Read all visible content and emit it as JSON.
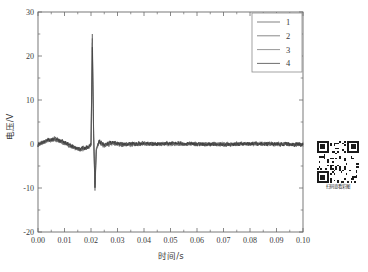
{
  "chart_data": {
    "type": "line",
    "title": "",
    "xlabel": "时间/s",
    "ylabel": "电压/V",
    "xlim": [
      0.0,
      0.1
    ],
    "ylim": [
      -20,
      30
    ],
    "xticks": [
      "0.00",
      "0.01",
      "0.02",
      "0.03",
      "0.04",
      "0.05",
      "0.06",
      "0.07",
      "0.08",
      "0.09",
      "0.10"
    ],
    "xtick_values": [
      0.0,
      0.01,
      0.02,
      0.03,
      0.04,
      0.05,
      0.06,
      0.07,
      0.08,
      0.09,
      0.1
    ],
    "yticks": [
      "30",
      "20",
      "10",
      "0",
      "-10",
      "-20"
    ],
    "ytick_values": [
      30,
      20,
      10,
      0,
      -10,
      -20
    ],
    "minor_tick_step_y": 5,
    "minor_tick_step_x": 0.005,
    "grid": false,
    "legend_position": "top-right",
    "legend_frame": true,
    "legend": [
      "1",
      "2",
      "3",
      "4"
    ],
    "series": [
      {
        "name": "1",
        "color": "#4a4a4a",
        "linewidth": 0.55,
        "noise_amp": 0.45,
        "noise_seed": 11,
        "spike_peak": 25.0,
        "spike_trough": -10.6,
        "x": [
          0.0,
          0.002,
          0.004,
          0.006,
          0.008,
          0.01,
          0.012,
          0.014,
          0.016,
          0.018,
          0.02,
          0.0205,
          0.021,
          0.0215,
          0.022,
          0.023,
          0.025,
          0.028,
          0.032,
          0.04,
          0.05,
          0.06,
          0.07,
          0.08,
          0.09,
          0.1
        ],
        "y": [
          -0.2,
          0.3,
          0.8,
          1.0,
          0.8,
          0.3,
          -0.3,
          -0.9,
          -1.3,
          -1.0,
          -0.4,
          25.0,
          2.0,
          -10.6,
          -1.5,
          0.6,
          -0.4,
          0.2,
          -0.2,
          0.0,
          0.1,
          -0.1,
          0.0,
          0.1,
          -0.1,
          -0.2
        ]
      },
      {
        "name": "2",
        "color": "#585858",
        "linewidth": 0.55,
        "noise_amp": 0.42,
        "noise_seed": 23,
        "spike_peak": 24.0,
        "spike_trough": -9.8,
        "x": [
          0.0,
          0.002,
          0.004,
          0.006,
          0.008,
          0.01,
          0.012,
          0.014,
          0.016,
          0.018,
          0.02,
          0.0205,
          0.021,
          0.0215,
          0.022,
          0.023,
          0.025,
          0.028,
          0.032,
          0.04,
          0.05,
          0.06,
          0.07,
          0.08,
          0.09,
          0.1
        ],
        "y": [
          -0.1,
          0.4,
          0.9,
          1.1,
          0.7,
          0.2,
          -0.4,
          -1.0,
          -1.2,
          -0.9,
          -0.3,
          24.0,
          1.6,
          -9.8,
          -1.2,
          0.5,
          -0.3,
          0.3,
          -0.1,
          0.1,
          -0.1,
          0.1,
          -0.1,
          0.0,
          0.1,
          -0.1
        ]
      },
      {
        "name": "3",
        "color": "#6a6a6a",
        "linewidth": 0.55,
        "noise_amp": 0.4,
        "noise_seed": 37,
        "spike_peak": 23.0,
        "spike_trough": -9.2,
        "x": [
          0.0,
          0.002,
          0.004,
          0.006,
          0.008,
          0.01,
          0.012,
          0.014,
          0.016,
          0.018,
          0.02,
          0.0205,
          0.021,
          0.0215,
          0.022,
          0.023,
          0.025,
          0.028,
          0.032,
          0.04,
          0.05,
          0.06,
          0.07,
          0.08,
          0.09,
          0.1
        ],
        "y": [
          -0.3,
          0.2,
          0.7,
          0.9,
          0.6,
          0.1,
          -0.5,
          -1.1,
          -1.4,
          -1.0,
          -0.5,
          23.0,
          1.2,
          -9.2,
          -1.4,
          0.4,
          -0.5,
          0.1,
          -0.3,
          -0.1,
          0.0,
          -0.1,
          0.1,
          -0.1,
          0.0,
          -0.2
        ]
      },
      {
        "name": "4",
        "color": "#3c3c3c",
        "linewidth": 0.6,
        "noise_amp": 0.48,
        "noise_seed": 53,
        "spike_peak": 22.0,
        "spike_trough": -10.0,
        "x": [
          0.0,
          0.002,
          0.004,
          0.006,
          0.008,
          0.01,
          0.012,
          0.014,
          0.016,
          0.018,
          0.02,
          0.0205,
          0.021,
          0.0215,
          0.022,
          0.023,
          0.025,
          0.028,
          0.032,
          0.04,
          0.05,
          0.06,
          0.07,
          0.08,
          0.09,
          0.1
        ],
        "y": [
          -0.2,
          0.5,
          1.0,
          1.2,
          0.9,
          0.4,
          -0.2,
          -0.8,
          -1.1,
          -0.8,
          -0.2,
          22.0,
          2.4,
          -10.0,
          -1.0,
          0.7,
          -0.2,
          0.4,
          0.0,
          0.1,
          0.2,
          0.0,
          -0.1,
          0.1,
          0.0,
          -0.1
        ]
      }
    ]
  },
  "qr": {
    "caption": "扫码查看彩图"
  },
  "style": {
    "axis_color": "#6b6b6b",
    "text_color": "#3a3a3a",
    "background": "#ffffff",
    "legend_border": "#8c8c8c"
  }
}
